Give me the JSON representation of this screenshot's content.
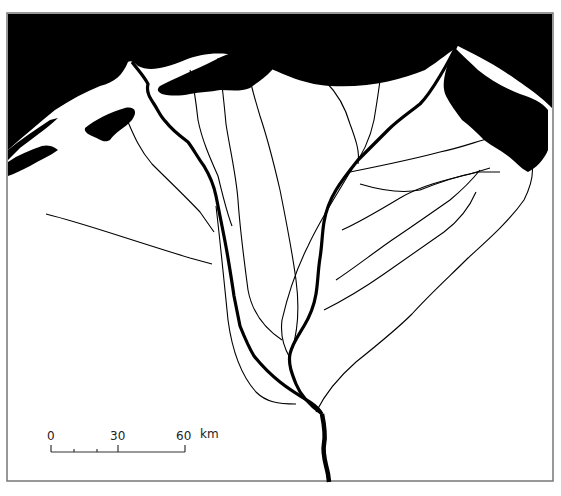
{
  "map": {
    "title": "",
    "sea_color": "#000000",
    "land_color": "#ffffff",
    "river_color": "#000000",
    "frame_color": "#777777"
  },
  "scale_bar": {
    "labels": [
      "0",
      "30",
      "60"
    ],
    "unit": "km"
  }
}
